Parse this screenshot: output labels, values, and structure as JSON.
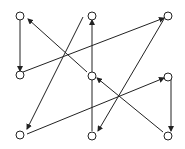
{
  "diagram": {
    "type": "directed-graph",
    "width": 185,
    "height": 149,
    "stroke_color": "#222222",
    "node_fill": "#ffffff",
    "node_radius": 4,
    "nodes": [
      {
        "id": "A",
        "x": 20,
        "y": 16
      },
      {
        "id": "B",
        "x": 92,
        "y": 16
      },
      {
        "id": "C",
        "x": 168,
        "y": 16
      },
      {
        "id": "D",
        "x": 20,
        "y": 75
      },
      {
        "id": "E",
        "x": 92,
        "y": 76
      },
      {
        "id": "F",
        "x": 168,
        "y": 77
      },
      {
        "id": "G",
        "x": 20,
        "y": 135
      },
      {
        "id": "H",
        "x": 92,
        "y": 136
      },
      {
        "id": "I",
        "x": 168,
        "y": 136
      }
    ],
    "edges": [
      {
        "from": "A",
        "to": "D",
        "x1": 20,
        "y1": 20,
        "x2": 20,
        "y2": 71
      },
      {
        "from": "E",
        "to": "A",
        "x1": 87,
        "y1": 72,
        "x2": 28,
        "y2": 19
      },
      {
        "from": "D",
        "to": "C",
        "x1": 23,
        "y1": 72,
        "x2": 164,
        "y2": 18
      },
      {
        "from": "B",
        "to": "G",
        "x1": 83,
        "y1": 17,
        "x2": 27,
        "y2": 129
      },
      {
        "from": "H",
        "to": "B",
        "x1": 92,
        "y1": 131,
        "x2": 92,
        "y2": 20
      },
      {
        "from": "C",
        "to": "H",
        "x1": 164,
        "y1": 19,
        "x2": 98,
        "y2": 131
      },
      {
        "from": "G",
        "to": "F",
        "x1": 27,
        "y1": 134,
        "x2": 164,
        "y2": 78
      },
      {
        "from": "I",
        "to": "E",
        "x1": 163,
        "y1": 132,
        "x2": 97,
        "y2": 78
      },
      {
        "from": "F",
        "to": "I",
        "x1": 171,
        "y1": 77,
        "x2": 171,
        "y2": 131
      }
    ]
  }
}
